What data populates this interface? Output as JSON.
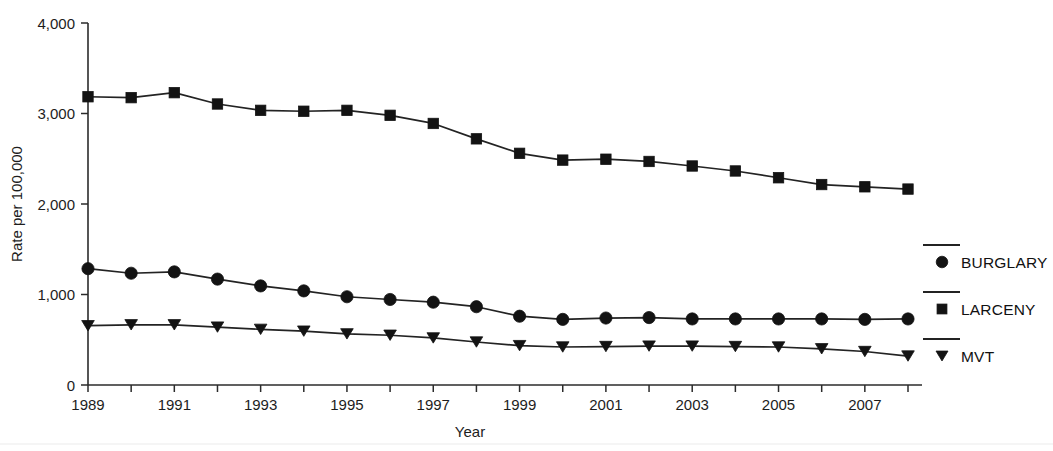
{
  "chart_data": {
    "type": "line",
    "title": "",
    "xlabel": "Year",
    "ylabel": "Rate per 100,000",
    "x": [
      1989,
      1990,
      1991,
      1992,
      1993,
      1994,
      1995,
      1996,
      1997,
      1998,
      1999,
      2000,
      2001,
      2002,
      2003,
      2004,
      2005,
      2006,
      2007,
      2008
    ],
    "xlim": [
      1989,
      2008
    ],
    "ylim": [
      0,
      4000
    ],
    "yticks": [
      0,
      1000,
      2000,
      3000,
      4000
    ],
    "ytick_labels": [
      "0",
      "1,000",
      "2,000",
      "3,000",
      "4,000"
    ],
    "xticks": [
      1989,
      1990,
      1991,
      1992,
      1993,
      1994,
      1995,
      1996,
      1997,
      1998,
      1999,
      2000,
      2001,
      2002,
      2003,
      2004,
      2005,
      2006,
      2007,
      2008
    ],
    "xtick_labels": [
      "1989",
      "",
      "1991",
      "",
      "1993",
      "",
      "1995",
      "",
      "1997",
      "",
      "1999",
      "",
      "2001",
      "",
      "2003",
      "",
      "2005",
      "",
      "2007",
      ""
    ],
    "grid": false,
    "legend_position": "right",
    "series": [
      {
        "name": "BURGLARY",
        "marker": "circle",
        "values": [
          1285,
          1235,
          1250,
          1170,
          1095,
          1040,
          975,
          945,
          915,
          865,
          760,
          725,
          740,
          745,
          730,
          730,
          730,
          730,
          725,
          730
        ]
      },
      {
        "name": "LARCENY",
        "marker": "square",
        "values": [
          3185,
          3175,
          3230,
          3105,
          3035,
          3025,
          3035,
          2980,
          2890,
          2720,
          2560,
          2485,
          2495,
          2470,
          2420,
          2365,
          2290,
          2215,
          2190,
          2165
        ]
      },
      {
        "name": "MVT",
        "marker": "triangle-down",
        "values": [
          655,
          665,
          665,
          640,
          615,
          595,
          565,
          550,
          520,
          475,
          435,
          420,
          425,
          430,
          430,
          425,
          420,
          400,
          370,
          320
        ]
      }
    ]
  },
  "legend": {
    "items": [
      {
        "label": "BURGLARY",
        "marker": "circle"
      },
      {
        "label": "LARCENY",
        "marker": "square"
      },
      {
        "label": "MVT",
        "marker": "triangle-down"
      }
    ]
  },
  "colors": {
    "ink": "#131313",
    "axis": "#2b2b2b",
    "background": "#ffffff"
  }
}
